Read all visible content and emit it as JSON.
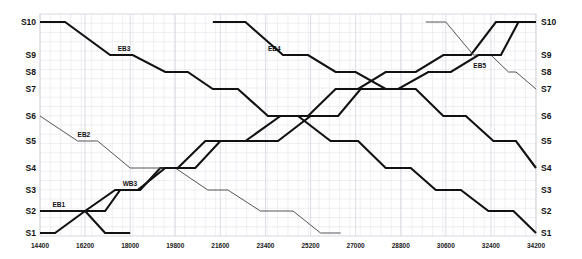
{
  "chart_data": {
    "type": "line",
    "title": "",
    "subtitle": "",
    "xlabel": "",
    "ylabel": "",
    "grid": true,
    "legend_position": "inline-labels",
    "xlim": [
      14400,
      34200
    ],
    "x_tick_labels": [
      "14400",
      "16200",
      "18000",
      "19800",
      "21600",
      "23400",
      "25200",
      "27000",
      "28800",
      "30600",
      "32400",
      "34200"
    ],
    "x_ticks": [
      14400,
      16200,
      18000,
      19800,
      21600,
      23400,
      25200,
      27000,
      28800,
      30600,
      32400,
      34200
    ],
    "y_categories_left": [
      "S10",
      "S9",
      "S8",
      "S7",
      "S6",
      "S5",
      "S4",
      "S3",
      "S2",
      "S1"
    ],
    "y_categories_right": [
      "S10",
      "S9",
      "S8",
      "S7",
      "S6",
      "S5",
      "S4",
      "S3",
      "S2",
      "S1"
    ],
    "station_order_top_to_bottom": [
      "S10",
      "S9",
      "S8",
      "S7",
      "S6",
      "S5",
      "S4",
      "S3",
      "S2",
      "S1"
    ],
    "series": [
      {
        "name": "EB1",
        "label": "EB1",
        "style": "thick",
        "color": "#111111",
        "label_x": 14900,
        "label_y_station": "S2",
        "points": [
          {
            "x": 14400,
            "y": "S2"
          },
          {
            "x": 14900,
            "y": "S2"
          },
          {
            "x": 15500,
            "y": "S2"
          },
          {
            "x": 16200,
            "y": "S2"
          },
          {
            "x": 17000,
            "y": "S2"
          },
          {
            "x": 17600,
            "y": "S3"
          },
          {
            "x": 18400,
            "y": "S3"
          },
          {
            "x": 19200,
            "y": "S4"
          },
          {
            "x": 19900,
            "y": "S4"
          },
          {
            "x": 21000,
            "y": "S5"
          },
          {
            "x": 22600,
            "y": "S5"
          },
          {
            "x": 24000,
            "y": "S6"
          },
          {
            "x": 25100,
            "y": "S6"
          },
          {
            "x": 26200,
            "y": "S7"
          },
          {
            "x": 27100,
            "y": "S7"
          },
          {
            "x": 28200,
            "y": "S8"
          },
          {
            "x": 29400,
            "y": "S8"
          },
          {
            "x": 30500,
            "y": "S9"
          },
          {
            "x": 31600,
            "y": "S9"
          },
          {
            "x": 32600,
            "y": "S10"
          },
          {
            "x": 34200,
            "y": "S10"
          }
        ]
      },
      {
        "name": "EB2",
        "label": "EB2",
        "style": "thin",
        "color": "#555555",
        "label_x": 15900,
        "label_y_station": "S5",
        "points": [
          {
            "x": 14400,
            "y": "S6"
          },
          {
            "x": 15900,
            "y": "S5"
          },
          {
            "x": 16700,
            "y": "S5"
          },
          {
            "x": 18000,
            "y": "S4"
          },
          {
            "x": 19800,
            "y": "S4"
          },
          {
            "x": 21100,
            "y": "S3"
          },
          {
            "x": 21900,
            "y": "S3"
          },
          {
            "x": 23200,
            "y": "S2"
          },
          {
            "x": 24500,
            "y": "S2"
          },
          {
            "x": 25600,
            "y": "S1"
          },
          {
            "x": 26400,
            "y": "S1"
          }
        ]
      },
      {
        "name": "EB3",
        "label": "EB3",
        "style": "thick",
        "color": "#111111",
        "label_x": 17500,
        "label_y_station": "S9",
        "points": [
          {
            "x": 14400,
            "y": "S10"
          },
          {
            "x": 15400,
            "y": "S10"
          },
          {
            "x": 17200,
            "y": "S9"
          },
          {
            "x": 18100,
            "y": "S9"
          },
          {
            "x": 19400,
            "y": "S8"
          },
          {
            "x": 20300,
            "y": "S8"
          },
          {
            "x": 21300,
            "y": "S7"
          },
          {
            "x": 22300,
            "y": "S7"
          },
          {
            "x": 23500,
            "y": "S6"
          },
          {
            "x": 24700,
            "y": "S6"
          },
          {
            "x": 26000,
            "y": "S5"
          },
          {
            "x": 27100,
            "y": "S5"
          },
          {
            "x": 28200,
            "y": "S4"
          },
          {
            "x": 29200,
            "y": "S4"
          },
          {
            "x": 30200,
            "y": "S3"
          },
          {
            "x": 31200,
            "y": "S3"
          },
          {
            "x": 32300,
            "y": "S2"
          },
          {
            "x": 33300,
            "y": "S2"
          },
          {
            "x": 34200,
            "y": "S1"
          }
        ]
      },
      {
        "name": "EB4",
        "label": "EB4",
        "style": "thick",
        "color": "#111111",
        "label_x": 23500,
        "label_y_station": "S9",
        "points": [
          {
            "x": 21300,
            "y": "S10"
          },
          {
            "x": 22600,
            "y": "S10"
          },
          {
            "x": 24100,
            "y": "S9"
          },
          {
            "x": 25100,
            "y": "S9"
          },
          {
            "x": 26200,
            "y": "S8"
          },
          {
            "x": 27000,
            "y": "S8"
          },
          {
            "x": 28200,
            "y": "S7"
          },
          {
            "x": 29400,
            "y": "S7"
          },
          {
            "x": 30500,
            "y": "S6"
          },
          {
            "x": 31400,
            "y": "S6"
          },
          {
            "x": 32500,
            "y": "S5"
          },
          {
            "x": 33400,
            "y": "S5"
          },
          {
            "x": 34200,
            "y": "S4"
          }
        ]
      },
      {
        "name": "EB5",
        "label": "EB5",
        "style": "thin",
        "color": "#555555",
        "label_x": 31700,
        "label_y_station": "S8",
        "points": [
          {
            "x": 29800,
            "y": "S10"
          },
          {
            "x": 30600,
            "y": "S10"
          },
          {
            "x": 31700,
            "y": "S9"
          },
          {
            "x": 32400,
            "y": "S9"
          },
          {
            "x": 33100,
            "y": "S8"
          },
          {
            "x": 33400,
            "y": "S8"
          },
          {
            "x": 34200,
            "y": "S7"
          }
        ]
      },
      {
        "name": "WB3",
        "label": "WB3",
        "style": "thick",
        "color": "#111111",
        "label_x": 17700,
        "label_y_station": "S3",
        "points": [
          {
            "x": 14400,
            "y": "S1"
          },
          {
            "x": 15000,
            "y": "S1"
          },
          {
            "x": 16200,
            "y": "S2"
          },
          {
            "x": 17400,
            "y": "S3"
          },
          {
            "x": 18300,
            "y": "S3"
          },
          {
            "x": 19400,
            "y": "S4"
          },
          {
            "x": 20600,
            "y": "S4"
          },
          {
            "x": 21600,
            "y": "S5"
          },
          {
            "x": 23900,
            "y": "S5"
          },
          {
            "x": 25200,
            "y": "S6"
          },
          {
            "x": 26300,
            "y": "S6"
          },
          {
            "x": 27200,
            "y": "S7"
          },
          {
            "x": 28700,
            "y": "S7"
          },
          {
            "x": 29900,
            "y": "S8"
          },
          {
            "x": 30800,
            "y": "S8"
          },
          {
            "x": 31900,
            "y": "S9"
          },
          {
            "x": 32800,
            "y": "S9"
          },
          {
            "x": 33500,
            "y": "S10"
          },
          {
            "x": 34200,
            "y": "S10"
          }
        ]
      },
      {
        "name": "WB1",
        "label": "",
        "style": "thick",
        "color": "#111111",
        "label_x": 0,
        "label_y_station": "S1",
        "points": [
          {
            "x": 16200,
            "y": "S2"
          },
          {
            "x": 17000,
            "y": "S1"
          },
          {
            "x": 18000,
            "y": "S1"
          }
        ]
      }
    ]
  },
  "axes": {
    "left_axis_name": "station-axis-left",
    "right_axis_name": "station-axis-right",
    "bottom_axis_name": "time-axis"
  },
  "colors": {
    "background": "#ffffff",
    "grid": "#e4e4ec",
    "thick_line": "#111111",
    "thin_line": "#555555",
    "text": "#111111",
    "frame": "#d9d9e0"
  }
}
